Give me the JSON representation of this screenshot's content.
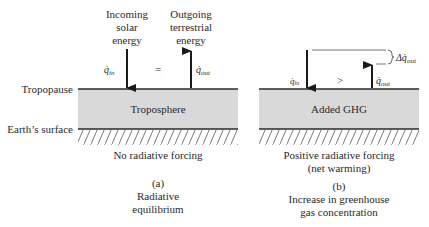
{
  "labels": {
    "tropopause": "Tropopause",
    "earth_surface": "Earth’s surface"
  },
  "panel_a": {
    "incoming_label": [
      "Incoming",
      "solar",
      "energy"
    ],
    "outgoing_label": [
      "Outgoing",
      "terrestrial",
      "energy"
    ],
    "q_in": "q̇",
    "q_in_sub": "in",
    "q_out": "q̇",
    "q_out_sub": "out",
    "relation": "=",
    "layer_label": "Troposphere",
    "forcing_caption": [
      "No radiative forcing"
    ],
    "panel_letter": "(a)",
    "panel_title": [
      "Radiative",
      "equilibrium"
    ]
  },
  "panel_b": {
    "q_in": "q̇",
    "q_in_sub": "in",
    "q_out": "q̇",
    "q_out_sub": "out",
    "relation": ">",
    "delta_label": "Δq̇",
    "delta_sub": "out",
    "layer_label": "Added GHG",
    "forcing_caption": [
      "Positive radiative forcing",
      "(net warming)"
    ],
    "panel_letter": "(b)",
    "panel_title": [
      "Increase in greenhouse",
      "gas concentration"
    ]
  },
  "colors": {
    "layer_fill": "#d9d9d9",
    "line": "#2a2a2a",
    "hatch": "#555555",
    "bracket": "#777777"
  }
}
